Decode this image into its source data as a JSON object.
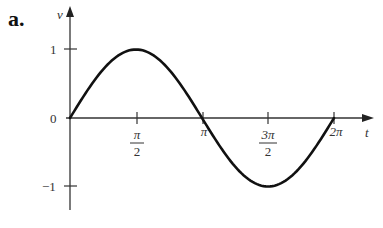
{
  "panel_label": "a.",
  "chart_data": {
    "type": "line",
    "title": "",
    "function": "v = sin(t)",
    "xlabel": "t",
    "ylabel": "v",
    "xlim": [
      0,
      6.2832
    ],
    "ylim": [
      -1.3,
      1.3
    ],
    "grid": false,
    "legend": null,
    "x_ticks": [
      {
        "value": 1.5708,
        "label_num": "π",
        "label_den": "2",
        "label": "π/2"
      },
      {
        "value": 3.1416,
        "label": "π"
      },
      {
        "value": 4.7124,
        "label_num": "3π",
        "label_den": "2",
        "label": "3π/2"
      },
      {
        "value": 6.2832,
        "label": "2π"
      }
    ],
    "y_ticks": [
      {
        "value": 1,
        "label": "1"
      },
      {
        "value": 0,
        "label": "0"
      },
      {
        "value": -1,
        "label": "−1"
      }
    ],
    "series": [
      {
        "name": "v",
        "x": [
          0,
          0.7854,
          1.5708,
          2.3562,
          3.1416,
          3.927,
          4.7124,
          5.4978,
          6.2832
        ],
        "values": [
          0,
          0.707,
          1,
          0.707,
          0,
          -0.707,
          -1,
          -0.707,
          0
        ]
      }
    ]
  }
}
